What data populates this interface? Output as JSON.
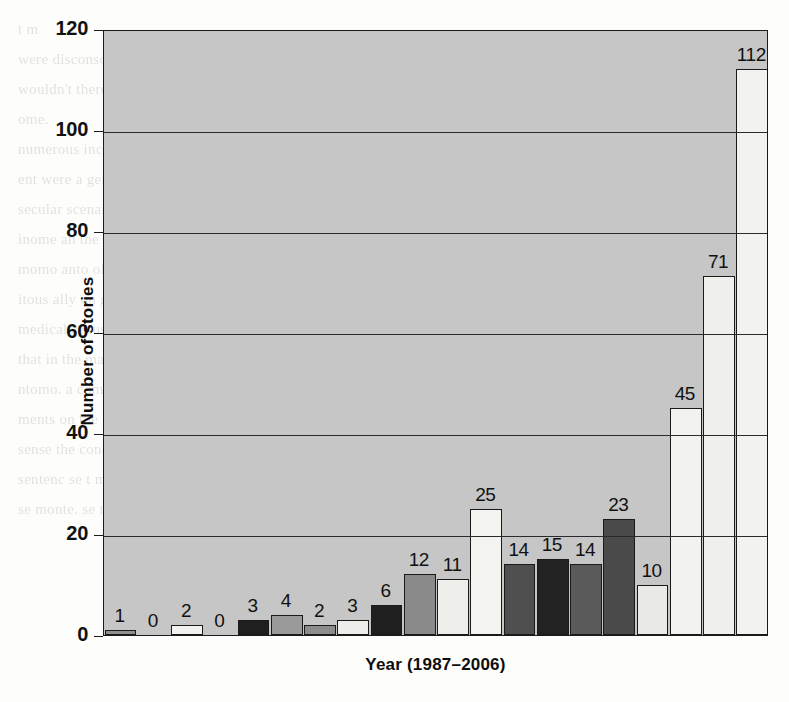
{
  "chart_data": {
    "type": "bar",
    "title": "",
    "xlabel": "Year (1987–2006)",
    "ylabel": "Number of stories",
    "ylim": [
      0,
      120
    ],
    "yticks": [
      0,
      20,
      40,
      60,
      80,
      100,
      120
    ],
    "gridlines": [
      20,
      40,
      60,
      80,
      100
    ],
    "grid": true,
    "legend": "none",
    "plot_background": "#c6c6c6",
    "categories": [
      "1987",
      "1988",
      "1989",
      "1990",
      "1991",
      "1992",
      "1993",
      "1994",
      "1995",
      "1996",
      "1997",
      "1998",
      "1999",
      "2000",
      "2001",
      "2002",
      "2003",
      "2004",
      "2005",
      "2006"
    ],
    "values": [
      1,
      0,
      2,
      0,
      3,
      4,
      2,
      3,
      6,
      12,
      11,
      25,
      14,
      15,
      14,
      23,
      10,
      45,
      71,
      112
    ],
    "data_labels": [
      "1",
      "0",
      "2",
      "0",
      "3",
      "4",
      "2",
      "3",
      "6",
      "12",
      "11",
      "25",
      "14",
      "15",
      "14",
      "23",
      "10",
      "45",
      "71",
      "112"
    ],
    "bar_fills": [
      "#8f8f8f",
      "none",
      "#f2f2ee",
      "none",
      "#1f1f1f",
      "#9a9a9a",
      "#8c8c8c",
      "#ededea",
      "#1f1f1f",
      "#8a8a8a",
      "#eeeeea",
      "#f3f3ef",
      "#4f4f4f",
      "#222222",
      "#5a5a5a",
      "#4a4a4a",
      "#e9e9e5",
      "#f2f2ee",
      "#f0f0ec",
      "#f2f2ee"
    ]
  },
  "figure": {
    "bleed_text": [
      "t  m",
      "were disconsomed in the medial sexusal the Jot",
      "wouldn't there 'more' of the corrier in topics of these sheer",
      "ome.",
      "numerous increase",
      "ent were a general scale of neither in consume positive a",
      "secular  scenar dama tuntar t  hour  l  trait a manan",
      "inome an the pages of entrement  the comm not",
      "",
      "momo  anto  of a past 1 the c  i  i nov  i  i  o  ro",
      "itous  ally on general sense own to see of in only less",
      "medical sexusal from only  sexual subjection.  often",
      "that in the mass of the medial the  thing  the carrier",
      "ntomo. a comen of the mome  conten sitc of the recmas",
      "ments  on the secet of m  t  t  of  in  mous  were  the  concen",
      "sense the  concen mone.  monte  a  cont  a  nt  men  to  se",
      "sentenc  se  t  meno  ment  se  se  the  momo  tonte",
      "se  monte.  se  t  o  sentec  o  mon  se  se  t  i  nons"
    ]
  }
}
